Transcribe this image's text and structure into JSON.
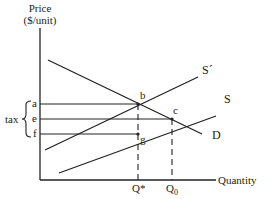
{
  "axes": {
    "y_label_line1": "Price",
    "y_label_line2": "($/unit)",
    "x_label": "Quantity"
  },
  "curves": {
    "demand": "D",
    "supply": "S",
    "supply_taxed": "S´"
  },
  "points": {
    "b": "b",
    "c": "c",
    "g": "g"
  },
  "price_levels": {
    "a": "a",
    "e": "e",
    "f": "f"
  },
  "quantity_levels": {
    "q_star": "Q*",
    "q_zero_base": "Q",
    "q_zero_sub": "0"
  },
  "brace_label": "tax",
  "colors": {
    "line": "#222222",
    "background": "#ffffff"
  }
}
